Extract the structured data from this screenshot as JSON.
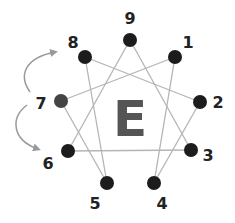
{
  "diagram": {
    "center_letter": "E",
    "colors": {
      "node": "#1c1c1c",
      "node_7": "#444444",
      "line": "#b5b5b5",
      "arrow": "#9a9a9a",
      "label": "#222222",
      "center": "#555555"
    },
    "nodes": [
      {
        "id": "9",
        "label": "9",
        "x": 130,
        "y": 40,
        "lx": 130,
        "ly": 24
      },
      {
        "id": "1",
        "label": "1",
        "x": 175,
        "y": 57,
        "lx": 188,
        "ly": 48
      },
      {
        "id": "2",
        "label": "2",
        "x": 200,
        "y": 102,
        "lx": 218,
        "ly": 108
      },
      {
        "id": "3",
        "label": "3",
        "x": 191,
        "y": 150,
        "lx": 208,
        "ly": 161
      },
      {
        "id": "4",
        "label": "4",
        "x": 154,
        "y": 183,
        "lx": 162,
        "ly": 209
      },
      {
        "id": "5",
        "label": "5",
        "x": 107,
        "y": 183,
        "lx": 95,
        "ly": 209
      },
      {
        "id": "6",
        "label": "6",
        "x": 68,
        "y": 151,
        "lx": 48,
        "ly": 169
      },
      {
        "id": "7",
        "label": "7",
        "x": 61,
        "y": 101,
        "lx": 41,
        "ly": 109
      },
      {
        "id": "8",
        "label": "8",
        "x": 85,
        "y": 57,
        "lx": 73,
        "ly": 48
      }
    ],
    "edges": [
      [
        "9",
        "3"
      ],
      [
        "9",
        "6"
      ],
      [
        "3",
        "6"
      ],
      [
        "1",
        "4"
      ],
      [
        "4",
        "2"
      ],
      [
        "2",
        "8"
      ],
      [
        "8",
        "5"
      ],
      [
        "5",
        "7"
      ],
      [
        "7",
        "1"
      ]
    ],
    "arrows": [
      {
        "from": "7",
        "to": "8",
        "label": "7 to 8"
      },
      {
        "from": "7",
        "to": "6",
        "label": "7 to 6"
      }
    ]
  }
}
